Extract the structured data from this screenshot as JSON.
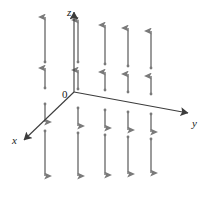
{
  "figure": {
    "background_color": "#ffffff",
    "arrow_color": "#7a7a7a",
    "axis_color": "#3c3c3c",
    "label_color": "#1a1a1a"
  },
  "axes": {
    "z": {
      "label": "z",
      "label_x": 67,
      "label_y": 16
    },
    "y": {
      "label": "y",
      "label_x": 192,
      "label_y": 127
    },
    "x": {
      "label": "x",
      "label_x": 12,
      "label_y": 144
    },
    "origin": {
      "label": "0",
      "label_x": 62,
      "label_y": 98
    },
    "origin_x": 74,
    "origin_y": 92,
    "z_tip_x": 74,
    "z_tip_y": 12,
    "y_tip_x": 188,
    "y_tip_y": 113,
    "x_tip_x": 24,
    "x_tip_y": 140
  },
  "chart_data": {
    "type": "scatter",
    "xlabel": "x",
    "ylabel": "y",
    "zlabel": "z",
    "vector_columns": [
      {
        "id": "col-1",
        "cx": 45,
        "upper_long_top": 17,
        "upper_long_bottom": 62,
        "upper_short_top": 68,
        "upper_short_bottom": 88,
        "lower_short_top": 104,
        "lower_short_bottom": 122,
        "lower_long_top": 131,
        "lower_long_bottom": 176
      },
      {
        "id": "col-2",
        "cx": 78,
        "upper_long_top": 20,
        "upper_long_bottom": 62,
        "upper_short_top": 70,
        "upper_short_bottom": 89,
        "lower_short_top": 108,
        "lower_short_bottom": 126,
        "lower_long_top": 133,
        "lower_long_bottom": 176
      },
      {
        "id": "col-3",
        "cx": 105,
        "upper_long_top": 25,
        "upper_long_bottom": 64,
        "upper_short_top": 72,
        "upper_short_bottom": 90,
        "lower_short_top": 110,
        "lower_short_bottom": 128,
        "lower_long_top": 135,
        "lower_long_bottom": 175
      },
      {
        "id": "col-4",
        "cx": 128,
        "upper_long_top": 28,
        "upper_long_bottom": 66,
        "upper_short_top": 74,
        "upper_short_bottom": 92,
        "lower_short_top": 112,
        "lower_short_bottom": 130,
        "lower_long_top": 137,
        "lower_long_bottom": 174
      },
      {
        "id": "col-5",
        "cx": 151,
        "upper_long_top": 31,
        "upper_long_bottom": 68,
        "upper_short_top": 76,
        "upper_short_bottom": 94,
        "lower_short_top": 114,
        "lower_short_bottom": 132,
        "lower_long_top": 139,
        "lower_long_bottom": 173
      }
    ],
    "direction_above_plane": "up",
    "direction_below_plane": "down"
  }
}
